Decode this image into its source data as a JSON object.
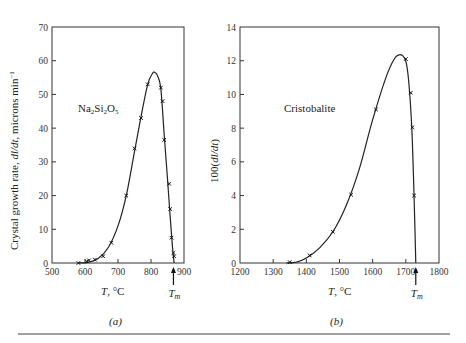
{
  "chart_data": [
    {
      "type": "line",
      "panel_label": "(a)",
      "title": "",
      "annotation": "Na2Si2O5",
      "annotation_parts": [
        "Na",
        "2",
        "Si",
        "2",
        "O",
        "5"
      ],
      "xlabel": "T, °C",
      "xlabel_parts": {
        "var": "T",
        "unit": ", °C"
      },
      "ylabel": "Crystal growth rate, dl/dt, microns min⁻¹",
      "ylabel_parts": {
        "pre": "Crystal growth rate, ",
        "var": "dl/dt",
        "post": ", microns min",
        "sup": "−1"
      },
      "xlim": [
        500,
        900
      ],
      "ylim": [
        0,
        70
      ],
      "xticks": [
        500,
        600,
        700,
        800,
        900
      ],
      "yticks": [
        0,
        10,
        20,
        30,
        40,
        50,
        60,
        70
      ],
      "melting_point_label": "Tm",
      "melting_point_x": 868,
      "grid": false,
      "series": [
        {
          "name": "Na2Si2O5 measured",
          "marker": "x",
          "x": [
            580,
            605,
            612,
            630,
            655,
            680,
            725,
            750,
            770,
            790,
            830,
            835,
            840,
            855,
            858,
            862,
            868,
            870
          ],
          "y": [
            0.0,
            0.5,
            0.8,
            1.0,
            2.0,
            6.0,
            20.0,
            34.0,
            43.0,
            53.0,
            52.0,
            48.0,
            36.5,
            23.5,
            16.0,
            7.5,
            3.0,
            2.0
          ]
        },
        {
          "name": "Na2Si2O5 fitted curve",
          "marker": "none",
          "x": [
            580,
            610,
            640,
            670,
            700,
            725,
            750,
            770,
            790,
            805,
            812,
            820,
            830,
            840,
            850,
            858,
            865,
            870
          ],
          "y": [
            0.0,
            0.2,
            1.3,
            4.5,
            11.0,
            20.0,
            33.0,
            43.5,
            53.0,
            56.3,
            56.5,
            55.5,
            51.5,
            38.0,
            25.0,
            14.0,
            5.0,
            0.0
          ]
        }
      ]
    },
    {
      "type": "line",
      "panel_label": "(b)",
      "title": "",
      "annotation": "Cristobalite",
      "xlabel": "T, °C",
      "xlabel_parts": {
        "var": "T",
        "unit": ", °C"
      },
      "ylabel": "100(dl/dt)",
      "ylabel_parts": {
        "pre": "100(",
        "var": "dl/dt",
        "post": ")"
      },
      "xlim": [
        1200,
        1800
      ],
      "ylim": [
        0,
        14
      ],
      "xticks": [
        1200,
        1300,
        1400,
        1500,
        1600,
        1700,
        1800
      ],
      "yticks": [
        0,
        2,
        4,
        6,
        8,
        10,
        12,
        14
      ],
      "melting_point_label": "Tm",
      "melting_point_x": 1730,
      "grid": false,
      "series": [
        {
          "name": "Cristobalite measured",
          "marker": "x",
          "x": [
            1350,
            1410,
            1480,
            1535,
            1610,
            1700,
            1715,
            1720,
            1725
          ],
          "y": [
            0.05,
            0.45,
            1.85,
            4.05,
            9.1,
            12.1,
            10.1,
            8.05,
            4.0
          ]
        },
        {
          "name": "Cristobalite fitted curve",
          "marker": "none",
          "x": [
            1340,
            1370,
            1400,
            1440,
            1480,
            1520,
            1560,
            1600,
            1640,
            1665,
            1680,
            1693,
            1702,
            1710,
            1718,
            1724,
            1730
          ],
          "y": [
            0.0,
            0.05,
            0.3,
            0.9,
            1.85,
            3.4,
            5.6,
            8.5,
            11.0,
            12.1,
            12.35,
            12.25,
            11.8,
            10.5,
            8.0,
            4.5,
            0.0
          ]
        }
      ]
    }
  ],
  "captions": {
    "a": "(a)",
    "b": "(b)"
  }
}
